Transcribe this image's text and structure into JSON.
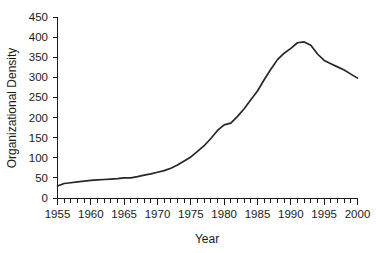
{
  "chart_data": {
    "type": "line",
    "title": "",
    "xlabel": "Year",
    "ylabel": "Organizational  Density",
    "xlim": [
      1955,
      2000
    ],
    "ylim": [
      0,
      450
    ],
    "grid": false,
    "legend": null,
    "y_ticks": [
      0,
      50,
      100,
      150,
      200,
      250,
      300,
      350,
      400,
      450
    ],
    "y_tick_labels": [
      "0",
      "50",
      "100",
      "150",
      "200",
      "250",
      "300",
      "350",
      "400",
      "450"
    ],
    "x_ticks": [
      1955,
      1960,
      1965,
      1970,
      1975,
      1980,
      1985,
      1990,
      1995,
      2000
    ],
    "x_tick_labels": [
      "1955",
      "1960",
      "1965",
      "1970",
      "1975",
      "1980",
      "1985",
      "1990",
      "1995",
      "2000"
    ],
    "x_minor_tick_step": 1,
    "x": [
      1955,
      1956,
      1957,
      1958,
      1959,
      1960,
      1961,
      1962,
      1963,
      1964,
      1965,
      1966,
      1967,
      1968,
      1969,
      1970,
      1971,
      1972,
      1973,
      1974,
      1975,
      1976,
      1977,
      1978,
      1979,
      1980,
      1981,
      1982,
      1983,
      1984,
      1985,
      1986,
      1987,
      1988,
      1989,
      1990,
      1991,
      1992,
      1993,
      1994,
      1995,
      1996,
      1997,
      1998,
      1999,
      2000
    ],
    "values": [
      30,
      36,
      38,
      40,
      42,
      44,
      45,
      46,
      47,
      48,
      50,
      50,
      53,
      57,
      60,
      64,
      68,
      74,
      82,
      92,
      102,
      116,
      130,
      148,
      168,
      182,
      186,
      203,
      222,
      244,
      266,
      294,
      320,
      344,
      360,
      372,
      386,
      388,
      380,
      358,
      342,
      334,
      326,
      318,
      308,
      298
    ],
    "series": [
      {
        "name": "Organizational Density",
        "values": [
          30,
          36,
          38,
          40,
          42,
          44,
          45,
          46,
          47,
          48,
          50,
          50,
          53,
          57,
          60,
          64,
          68,
          74,
          82,
          92,
          102,
          116,
          130,
          148,
          168,
          182,
          186,
          203,
          222,
          244,
          266,
          294,
          320,
          344,
          360,
          372,
          386,
          388,
          380,
          358,
          342,
          334,
          326,
          318,
          308,
          298
        ],
        "color": "#262626"
      }
    ],
    "peak": {
      "year": 1992,
      "value": 388
    },
    "start": {
      "year": 1955,
      "value": 30
    },
    "end": {
      "year": 2000,
      "value": 298
    }
  },
  "colors": {
    "line": "#262626",
    "axis": "#1a1a1a",
    "background": "#ffffff"
  }
}
